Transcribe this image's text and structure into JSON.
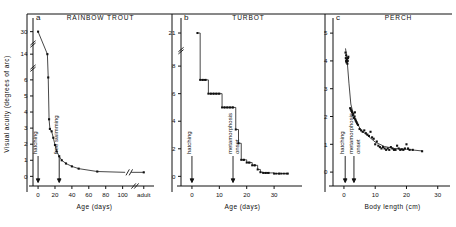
{
  "figure": {
    "background": "#ffffff",
    "ink": "#111111",
    "ylabel": "Visual acuity (degrees of arc)"
  },
  "chart_data": [
    {
      "type": "line",
      "panel": "a",
      "title": "RAINBOW TROUT",
      "xlabel": "Age (days)",
      "ylabel": "Visual acuity (degrees of arc)",
      "xticklabels": [
        "0",
        "20",
        "40",
        "60",
        "80",
        "100",
        "adult"
      ],
      "xticks": [
        0,
        20,
        40,
        60,
        80,
        100,
        125
      ],
      "yticklabels": [
        "0",
        "1",
        "2",
        "3",
        "4",
        "5",
        "6",
        "14",
        "30"
      ],
      "yticks": [
        0,
        1,
        2,
        3,
        4,
        5,
        6,
        7.6,
        9.0
      ],
      "xlim": [
        -6,
        130
      ],
      "ylim": [
        9.6,
        -0.6
      ],
      "grid": false,
      "axis_break_x": true,
      "axis_break_y": true,
      "y_axis_break_positions": [
        "between 6 and 14",
        "between 14 and 30"
      ],
      "curve_break": true,
      "annotations": [
        {
          "label": "hatching",
          "x": 0
        },
        {
          "label": "free swimming",
          "x": 25
        }
      ],
      "x": [
        0,
        11,
        12,
        13,
        14,
        16,
        18,
        20,
        22,
        25,
        28,
        33,
        40,
        48,
        70,
        125
      ],
      "y": [
        9.0,
        7.6,
        6.15,
        3.55,
        2.95,
        2.8,
        2.4,
        1.95,
        1.55,
        1.25,
        1.0,
        0.8,
        0.62,
        0.48,
        0.3,
        0.25
      ]
    },
    {
      "type": "line",
      "panel": "b",
      "title": "TURBOT",
      "xlabel": "Age (days)",
      "ylabel": "Visual acuity (degrees of arc)",
      "xticklabels": [
        "0",
        "10",
        "20",
        "30"
      ],
      "xticks": [
        0,
        10,
        20,
        30
      ],
      "yticklabels": [
        "0",
        "2",
        "4",
        "6",
        "8",
        "21"
      ],
      "yticks": [
        0,
        2,
        4,
        6,
        8,
        10.4
      ],
      "xlim": [
        -4,
        38
      ],
      "ylim": [
        11.2,
        -0.7
      ],
      "grid": false,
      "axis_break_y": true,
      "y_axis_break_positions": [
        "between 8 and 21"
      ],
      "step_plot": true,
      "annotations": [
        {
          "label": "hatching",
          "x": 0
        },
        {
          "label": "metamorphosis onset",
          "x": 15
        }
      ],
      "x": [
        2,
        3,
        4,
        5,
        6,
        7,
        8,
        9,
        10,
        11,
        12,
        13,
        14,
        15,
        16,
        17,
        18,
        19,
        20,
        21,
        22,
        23,
        24,
        25,
        26,
        27,
        28,
        30,
        32,
        35
      ],
      "y": [
        10.4,
        7.0,
        7.0,
        7.0,
        6.0,
        6.0,
        6.0,
        6.0,
        6.0,
        5.0,
        5.0,
        5.0,
        5.0,
        5.0,
        3.4,
        2.4,
        1.2,
        1.2,
        1.0,
        1.0,
        0.8,
        0.8,
        0.5,
        0.3,
        0.25,
        0.25,
        0.25,
        0.2,
        0.2,
        0.2
      ]
    },
    {
      "type": "scatter",
      "panel": "c",
      "title": "PERCH",
      "xlabel": "Body length (cm)",
      "ylabel": "Visual acuity (degrees of arc)",
      "xticklabels": [
        "0",
        "10",
        "20",
        "30"
      ],
      "xticks": [
        0,
        10,
        20,
        30
      ],
      "yticklabels": [
        "0",
        "1",
        "2",
        "3",
        "4",
        "5"
      ],
      "yticks": [
        0,
        1,
        2,
        3,
        4,
        5
      ],
      "xlim": [
        -3.5,
        32
      ],
      "ylim": [
        5.4,
        -0.5
      ],
      "grid": false,
      "fit_line": true,
      "annotations": [
        {
          "label": "hatching",
          "x": 0.4
        },
        {
          "label": "metamorphosis onset",
          "x": 3.2
        }
      ],
      "x": [
        0.5,
        0.6,
        0.7,
        0.7,
        0.8,
        0.9,
        1.0,
        1.1,
        1.2,
        1.3,
        1.4,
        2.0,
        2.2,
        2.4,
        2.6,
        2.8,
        3.0,
        3.2,
        3.4,
        3.5,
        3.6,
        3.8,
        4.0,
        4.2,
        4.5,
        5.0,
        5.5,
        6.0,
        6.5,
        7.0,
        7.5,
        8.0,
        8.5,
        9.0,
        9.5,
        10.0,
        10.5,
        11.0,
        11.5,
        12.0,
        12.5,
        13.0,
        13.5,
        14.0,
        14.5,
        15.0,
        15.5,
        16.0,
        16.5,
        17.0,
        17.5,
        18.0,
        18.5,
        19.0,
        19.5,
        20.0,
        20.5,
        21.0,
        22.0,
        25.0
      ],
      "y": [
        4.3,
        4.1,
        4.0,
        4.2,
        3.95,
        4.05,
        4.0,
        3.9,
        4.0,
        4.1,
        4.15,
        2.3,
        2.25,
        2.2,
        2.15,
        2.05,
        2.1,
        1.95,
        2.0,
        2.15,
        1.9,
        1.85,
        1.8,
        1.75,
        1.7,
        1.55,
        1.5,
        1.45,
        1.5,
        1.4,
        1.35,
        1.3,
        1.45,
        1.25,
        1.2,
        1.0,
        1.1,
        0.95,
        0.9,
        0.85,
        0.9,
        0.85,
        0.8,
        0.85,
        0.8,
        0.9,
        0.85,
        0.8,
        0.8,
        0.95,
        0.85,
        0.8,
        0.82,
        0.8,
        0.85,
        1.0,
        0.85,
        0.8,
        0.8,
        0.75
      ]
    }
  ]
}
